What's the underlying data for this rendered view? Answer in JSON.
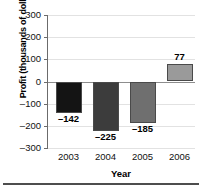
{
  "chart_data": {
    "type": "bar",
    "title": "",
    "xlabel": "Year",
    "ylabel": "Profit (thousands of dollars)",
    "categories": [
      "2003",
      "2004",
      "2005",
      "2006"
    ],
    "values": [
      -142,
      -225,
      -185,
      77
    ],
    "value_labels": [
      "–142",
      "–225",
      "–185",
      "77"
    ],
    "bar_colors": [
      "#141414",
      "#3c3c3c",
      "#6f6f6f",
      "#9a9a9a"
    ],
    "bar_border_color": "#4a4a4a",
    "ylim": [
      -300,
      300
    ],
    "yticks": [
      300,
      200,
      100,
      0,
      -100,
      -200,
      -300
    ],
    "ytick_labels": [
      "300",
      "200",
      "100",
      "0",
      "–100",
      "–200",
      "–300"
    ],
    "grid": true,
    "grid_color": "#e2e2e2",
    "zero_line_color": "#8d8d8d",
    "axis_color": "#6b6b6b",
    "legend": null,
    "legend_position": "none"
  }
}
